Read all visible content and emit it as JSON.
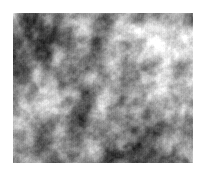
{
  "image": {
    "kind": "noise-texture",
    "title": "Grayscale Cloud Noise Texture",
    "alt_text": "Greyscale fractal cloud noise patch on a white background",
    "canvas": {
      "width": 206,
      "height": 176,
      "background_color": "#ffffff"
    },
    "texture": {
      "x": 13,
      "y": 13,
      "width": 180,
      "height": 150,
      "type": "fractal-perlin-cloud",
      "colorspace": "grayscale",
      "min_gray": "#1a1a1a",
      "max_gray": "#ffffff",
      "mean_gray": "#9e9e9e",
      "octaves": 5,
      "base_frequency": 0.055,
      "persistence": 0.55,
      "lacunarity": 2.0,
      "seed": 20240617,
      "contrast": 1.35,
      "brightness": 0.02,
      "grain_amplitude": 0.045,
      "scanline_amplitude": 0.02
    },
    "features": [
      {
        "label": "dark-blob-upper-left",
        "x": 45,
        "y": 38,
        "tone": "dark"
      },
      {
        "label": "dark-blob-upper-center",
        "x": 96,
        "y": 73,
        "tone": "dark"
      },
      {
        "label": "bright-blob-upper-center",
        "x": 122,
        "y": 72,
        "tone": "light"
      },
      {
        "label": "bright-blob-top-right",
        "x": 160,
        "y": 28,
        "tone": "light"
      },
      {
        "label": "bright-blob-right",
        "x": 168,
        "y": 93,
        "tone": "light"
      },
      {
        "label": "dark-blob-lower-center",
        "x": 72,
        "y": 134,
        "tone": "dark"
      },
      {
        "label": "dark-blob-lower-right",
        "x": 150,
        "y": 152,
        "tone": "dark"
      },
      {
        "label": "bright-blob-left",
        "x": 24,
        "y": 112,
        "tone": "light"
      },
      {
        "label": "dark-blob-left-edge",
        "x": 18,
        "y": 62,
        "tone": "dark"
      }
    ]
  }
}
